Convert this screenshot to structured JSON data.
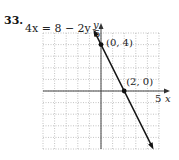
{
  "problem": {
    "number": "33.",
    "equation": "4x = 8 − 2y"
  },
  "chart_data": {
    "type": "line",
    "title": "4x = 8 − 2y",
    "xlabel": "x",
    "ylabel": "y",
    "xlim": [
      -5,
      5
    ],
    "ylim": [
      -5,
      5
    ],
    "grid": true,
    "tick_labels": {
      "x": [
        "5"
      ],
      "y": [
        "5"
      ]
    },
    "series": [
      {
        "name": "4x = 8 − 2y",
        "x": [
          -0.5,
          5.5
        ],
        "y": [
          5,
          -7
        ],
        "equation": "y = 4 − 2x"
      }
    ],
    "points": [
      {
        "label": "(0, 4)",
        "x": 0,
        "y": 4
      },
      {
        "label": "(2, 0)",
        "x": 2,
        "y": 0
      }
    ]
  }
}
